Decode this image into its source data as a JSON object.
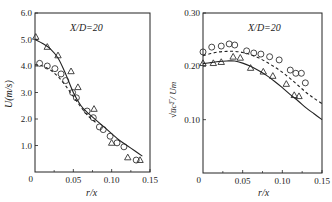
{
  "chart_data": [
    {
      "type": "line",
      "title": "",
      "annotation": "X/D=20",
      "xlabel": "r/x",
      "ylabel": "U(m/s)",
      "xlim": [
        0,
        0.15
      ],
      "ylim": [
        0,
        6.0
      ],
      "xticks": [
        "0",
        "0.05",
        "0.10",
        "0.15"
      ],
      "yticks": [
        "0",
        "1.0",
        "2.0",
        "3.0",
        "4.0",
        "5.0",
        "6.0"
      ],
      "grid": false,
      "legend": "none",
      "series": [
        {
          "name": "triangles (measured)",
          "marker": "triangle",
          "x": [
            0.001,
            0.016,
            0.03,
            0.047,
            0.056,
            0.077,
            0.1,
            0.121,
            0.137
          ],
          "y": [
            5.1,
            4.72,
            4.4,
            3.8,
            3.2,
            2.38,
            1.1,
            0.55,
            0.45
          ]
        },
        {
          "name": "circles (measured)",
          "marker": "circle",
          "x": [
            0.006,
            0.016,
            0.026,
            0.034,
            0.04,
            0.049,
            0.054,
            0.068,
            0.076,
            0.084,
            0.089,
            0.098,
            0.107,
            0.116,
            0.132
          ],
          "y": [
            4.1,
            4.0,
            3.9,
            3.7,
            3.45,
            3.0,
            2.8,
            2.3,
            2.05,
            1.7,
            1.6,
            1.35,
            1.1,
            0.95,
            0.45
          ]
        },
        {
          "name": "solid curve (prediction)",
          "style": "solid",
          "x": [
            0.0,
            0.01,
            0.02,
            0.03,
            0.04,
            0.05,
            0.06,
            0.07,
            0.08,
            0.09,
            0.1,
            0.11,
            0.12,
            0.13,
            0.14
          ],
          "y": [
            5.0,
            4.85,
            4.65,
            4.3,
            3.7,
            3.0,
            2.5,
            2.2,
            1.95,
            1.7,
            1.45,
            1.2,
            1.0,
            0.8,
            0.6
          ]
        },
        {
          "name": "dash-dot curve (prediction)",
          "style": "dashed",
          "x": [
            0.0,
            0.01,
            0.02,
            0.03,
            0.04,
            0.05,
            0.06,
            0.07,
            0.08
          ],
          "y": [
            4.05,
            4.0,
            3.85,
            3.6,
            3.25,
            2.85,
            2.45,
            2.1,
            1.85
          ]
        }
      ]
    },
    {
      "type": "line",
      "title": "",
      "annotation": "X/D=20",
      "xlabel": "r/x",
      "ylabel": "√(u_c²)/U_m",
      "xlim": [
        0,
        0.15
      ],
      "ylim": [
        0,
        0.3
      ],
      "xticks": [
        "0",
        "0.05",
        "0.10",
        "0.15"
      ],
      "yticks": [
        "0",
        "0.10",
        "0.20",
        "0.30"
      ],
      "grid": false,
      "legend": "none",
      "series": [
        {
          "name": "circles (measured)",
          "marker": "circle",
          "x": [
            0.0,
            0.011,
            0.023,
            0.033,
            0.04,
            0.055,
            0.064,
            0.073,
            0.084,
            0.096,
            0.11,
            0.117,
            0.124,
            0.129
          ],
          "y": [
            0.227,
            0.236,
            0.238,
            0.242,
            0.24,
            0.229,
            0.225,
            0.223,
            0.218,
            0.212,
            0.193,
            0.187,
            0.187,
            0.169
          ]
        },
        {
          "name": "triangles (measured)",
          "marker": "triangle",
          "x": [
            0.0,
            0.013,
            0.023,
            0.038,
            0.047,
            0.06,
            0.076,
            0.088,
            0.105,
            0.115,
            0.121
          ],
          "y": [
            0.206,
            0.206,
            0.208,
            0.218,
            0.216,
            0.197,
            0.19,
            0.182,
            0.167,
            0.146,
            0.144
          ]
        },
        {
          "name": "dashed curve (prediction)",
          "style": "dashed",
          "x": [
            0.0,
            0.01,
            0.02,
            0.03,
            0.04,
            0.05,
            0.06,
            0.07,
            0.08,
            0.09,
            0.1,
            0.11,
            0.12,
            0.13,
            0.14,
            0.15
          ],
          "y": [
            0.22,
            0.224,
            0.227,
            0.228,
            0.228,
            0.226,
            0.222,
            0.216,
            0.208,
            0.199,
            0.189,
            0.177,
            0.164,
            0.151,
            0.14,
            0.13
          ]
        },
        {
          "name": "solid curve (prediction)",
          "style": "solid",
          "x": [
            0.0,
            0.01,
            0.02,
            0.03,
            0.04,
            0.05,
            0.06,
            0.07,
            0.08,
            0.09,
            0.1,
            0.11,
            0.12,
            0.13,
            0.14,
            0.15
          ],
          "y": [
            0.205,
            0.207,
            0.209,
            0.21,
            0.21,
            0.206,
            0.2,
            0.192,
            0.183,
            0.172,
            0.16,
            0.147,
            0.135,
            0.122,
            0.111,
            0.1
          ]
        }
      ]
    }
  ],
  "labels": {
    "left": {
      "annotation": "X/D=20",
      "ylabel": "U(m/s)",
      "xlabel": "r/x",
      "yticks": [
        "0",
        "1.0",
        "2.0",
        "3.0",
        "4.0",
        "5.0",
        "6.0"
      ],
      "xticks": [
        "0",
        "0.05",
        "0.10",
        "0.15"
      ]
    },
    "right": {
      "annotation": "X/D=20",
      "ylabel": "√u̅c²̅ / Um",
      "xlabel": "r/x",
      "yticks": [
        "0",
        "0.10",
        "0.20",
        "0.30"
      ],
      "xticks": [
        "0",
        "0.05",
        "0.10",
        "0.15"
      ]
    }
  }
}
